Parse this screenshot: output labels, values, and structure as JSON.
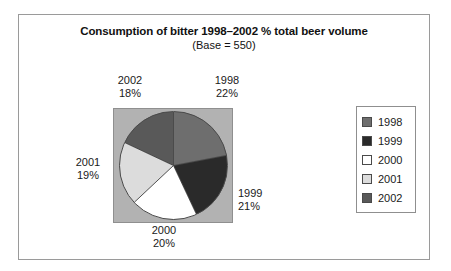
{
  "figure": {
    "title": "Consumption of bitter 1998–2002 % total beer volume",
    "subtitle": "(Base = 550)"
  },
  "labels": {
    "y1998": {
      "year": "1998",
      "percent": "22%"
    },
    "y1999": {
      "year": "1999",
      "percent": "21%"
    },
    "y2000": {
      "year": "2000",
      "percent": "20%"
    },
    "y2001": {
      "year": "2001",
      "percent": "19%"
    },
    "y2002": {
      "year": "2002",
      "percent": "18%"
    }
  },
  "legend": {
    "items": [
      {
        "label": "1998",
        "color": "#6e6e6e"
      },
      {
        "label": "1999",
        "color": "#2a2a2a"
      },
      {
        "label": "2000",
        "color": "#ffffff"
      },
      {
        "label": "2001",
        "color": "#dcdcdc"
      },
      {
        "label": "2002",
        "color": "#595959"
      }
    ]
  },
  "chart_data": {
    "type": "pie",
    "title": "Consumption of bitter 1998–2002 % total beer volume",
    "subtitle": "(Base = 550)",
    "base": 550,
    "unit": "% total beer volume",
    "categories": [
      "1998",
      "1999",
      "2000",
      "2001",
      "2002"
    ],
    "values": [
      22,
      21,
      20,
      19,
      18
    ],
    "value_labels": [
      "22%",
      "21%",
      "20%",
      "19%",
      "18%"
    ],
    "colors": [
      "#6e6e6e",
      "#2a2a2a",
      "#ffffff",
      "#dcdcdc",
      "#595959"
    ],
    "start_angle_deg": 0,
    "direction": "clockwise",
    "legend_position": "right",
    "plot_background": "#b2b2b2",
    "grid": false
  }
}
